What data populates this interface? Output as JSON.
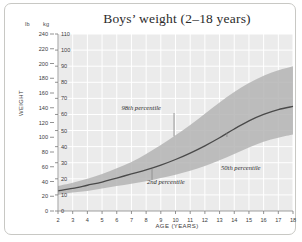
{
  "figure": {
    "title": "Boys’ weight (2–18 years)",
    "xlabel": "AGE (YEARS)",
    "ylabel": "WEIGHT",
    "unit_left": "lb",
    "unit_right": "kg"
  },
  "annotations": {
    "p98": "98th percentile",
    "p2": "2nd percentile",
    "p50": "50th percentile"
  },
  "colors": {
    "plot_background": "#ebebeb",
    "gridline": "#ffffff",
    "band_fill": "#b4b4b4",
    "median_line": "#4a4a4a",
    "leader_line": "#8c8c8c",
    "frame_border": "#c8c8c4",
    "text": "#2b2b2b"
  },
  "chart_data": {
    "type": "area",
    "title": "Boys’ weight (2–18 years)",
    "xlabel": "AGE (YEARS)",
    "ylabel": "WEIGHT",
    "grid": true,
    "legend": "none",
    "x": [
      2,
      3,
      4,
      5,
      6,
      7,
      8,
      9,
      10,
      11,
      12,
      13,
      14,
      15,
      16,
      17,
      18
    ],
    "xlim": [
      2,
      18
    ],
    "xticks": [
      2,
      3,
      4,
      5,
      6,
      7,
      8,
      9,
      10,
      11,
      12,
      13,
      14,
      15,
      16,
      17,
      18
    ],
    "y_axes": [
      {
        "name": "lb",
        "unit": "lb",
        "position": "outer-left",
        "ylim": [
          0,
          240
        ],
        "ticks": [
          0,
          20,
          40,
          60,
          80,
          100,
          120,
          140,
          160,
          180,
          200,
          220,
          240
        ]
      },
      {
        "name": "kg",
        "unit": "kg",
        "position": "inner-left",
        "ylim": [
          0,
          110
        ],
        "ticks": [
          0,
          10,
          20,
          30,
          40,
          50,
          60,
          70,
          80,
          90,
          100,
          110
        ]
      }
    ],
    "series": [
      {
        "name": "98th percentile",
        "unit": "kg",
        "values": [
          15.5,
          17.5,
          20.0,
          23.0,
          26.5,
          30.5,
          35.5,
          41.0,
          47.0,
          53.5,
          60.5,
          67.5,
          74.0,
          79.5,
          84.0,
          87.5,
          90.0
        ]
      },
      {
        "name": "50th percentile",
        "unit": "kg",
        "values": [
          12.5,
          14.0,
          16.0,
          18.0,
          20.5,
          23.0,
          25.5,
          28.5,
          32.0,
          36.0,
          40.5,
          45.5,
          51.0,
          56.0,
          60.0,
          63.0,
          65.0
        ]
      },
      {
        "name": "2nd percentile",
        "unit": "kg",
        "values": [
          10.0,
          11.5,
          12.5,
          14.0,
          15.5,
          17.0,
          18.5,
          20.5,
          22.5,
          25.0,
          28.0,
          31.5,
          35.5,
          39.5,
          43.0,
          45.5,
          47.5
        ]
      }
    ],
    "band": {
      "lower_series": "2nd percentile",
      "upper_series": "98th percentile",
      "fill": "#b4b4b4"
    },
    "annotations": [
      {
        "label": "98th percentile",
        "anchor_age": 9.9,
        "target_series": "98th percentile"
      },
      {
        "label": "2nd percentile",
        "anchor_age": 8.4,
        "target_series": "2nd percentile"
      },
      {
        "label": "50th percentile",
        "anchor_age": 13.5,
        "target_series": "50th percentile"
      }
    ]
  }
}
